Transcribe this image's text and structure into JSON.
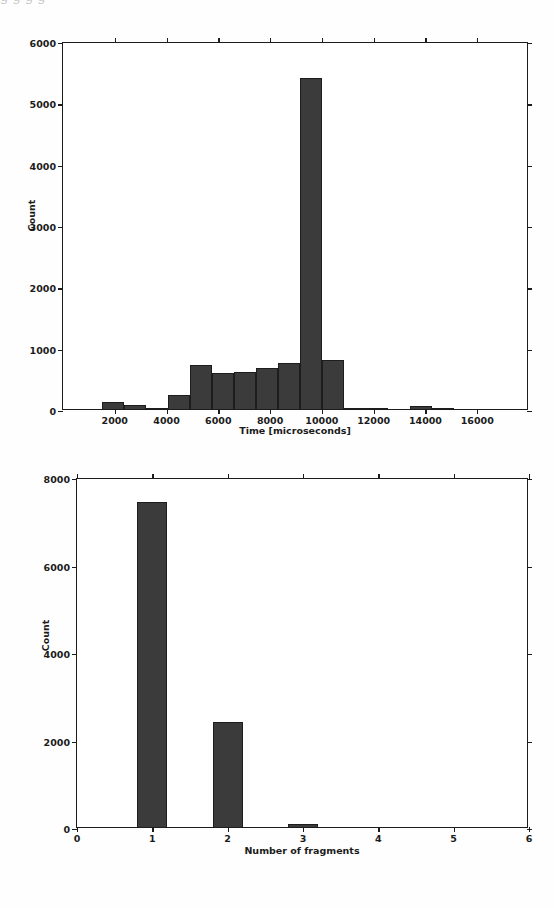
{
  "document": {
    "top_cut_text": "g  g        g            g"
  },
  "colors": {
    "bar_fill": "#3b3b3b",
    "bar_edge": "#1d1d1d",
    "axis": "#1c1c1c",
    "background": "#ffffff",
    "text": "#1b1b1b"
  },
  "chart_data": [
    {
      "id": "time-histogram",
      "type": "bar",
      "title": "",
      "xlabel": "Time [microseconds]",
      "ylabel": "Count",
      "xlim": [
        0,
        18000
      ],
      "ylim": [
        0,
        6000
      ],
      "xticks": [
        2000,
        4000,
        6000,
        8000,
        10000,
        12000,
        14000,
        16000
      ],
      "xtick_labels": [
        "2000",
        "4000",
        "6000",
        "8000",
        "10000",
        "12000",
        "14000",
        "16000"
      ],
      "yticks": [
        0,
        1000,
        2000,
        3000,
        4000,
        5000,
        6000
      ],
      "ytick_labels": [
        "0",
        "1000",
        "2000",
        "3000",
        "4000",
        "5000",
        "6000"
      ],
      "grid": false,
      "legend": "none",
      "bin_edges": [
        1500,
        2350,
        3200,
        4050,
        4900,
        5750,
        6600,
        7450,
        8300,
        9150,
        10000,
        10850,
        11700,
        12550,
        13400,
        14250,
        15100,
        15950,
        16800
      ],
      "values": [
        110,
        70,
        20,
        225,
        720,
        580,
        600,
        670,
        750,
        5400,
        800,
        20,
        10,
        0,
        45,
        10,
        0,
        0
      ]
    },
    {
      "id": "fragments-histogram",
      "type": "bar",
      "title": "",
      "xlabel": "Number of fragments",
      "ylabel": "Count",
      "xlim": [
        0,
        6
      ],
      "ylim": [
        0,
        8000
      ],
      "xticks": [
        0,
        1,
        2,
        3,
        4,
        5,
        6
      ],
      "xtick_labels": [
        "0",
        "1",
        "2",
        "3",
        "4",
        "5",
        "6"
      ],
      "yticks": [
        0,
        2000,
        4000,
        6000,
        8000
      ],
      "ytick_labels": [
        "0",
        "2000",
        "4000",
        "6000",
        "8000"
      ],
      "grid": false,
      "legend": "none",
      "categories": [
        1,
        2,
        3,
        4,
        5
      ],
      "values": [
        7430,
        2400,
        60,
        0,
        0
      ],
      "bar_width": 0.4
    }
  ]
}
